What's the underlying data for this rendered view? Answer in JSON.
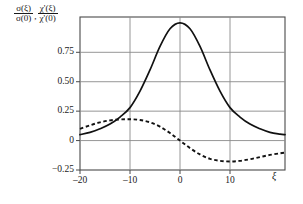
{
  "chart_data": {
    "type": "line",
    "title": "",
    "xlabel": "ξ",
    "ylabel_numerators": [
      "σ(ξ)",
      "χ'(ξ)"
    ],
    "ylabel_denominators": [
      "σ(0)",
      "χ'(0)"
    ],
    "ylabel_separator": ",",
    "xlim": [
      -20,
      21
    ],
    "ylim": [
      -0.25,
      1.05
    ],
    "grid": true,
    "legend_position": "none",
    "xticks": [
      -20,
      -10,
      0,
      10
    ],
    "xtick_labels": [
      "–20",
      "–10",
      "0",
      "10"
    ],
    "yticks": [
      -0.25,
      0,
      0.25,
      0.5,
      0.75
    ],
    "ytick_labels": [
      "−0.25",
      "0",
      "0.25",
      "0.50",
      "0.75"
    ],
    "series": [
      {
        "name": "σ(ξ)/σ(0)",
        "style": "solid",
        "color": "#111111",
        "x": [
          -20,
          -18,
          -16,
          -14,
          -12,
          -10,
          -8,
          -6,
          -4,
          -2,
          0,
          2,
          4,
          6,
          8,
          10,
          12,
          14,
          16,
          18,
          20,
          21
        ],
        "y": [
          0.05,
          0.07,
          0.1,
          0.14,
          0.2,
          0.28,
          0.42,
          0.6,
          0.8,
          0.95,
          1.0,
          0.95,
          0.8,
          0.6,
          0.42,
          0.28,
          0.2,
          0.14,
          0.1,
          0.07,
          0.055,
          0.05
        ]
      },
      {
        "name": "χ'(ξ)/χ'(0)",
        "style": "dashed",
        "color": "#111111",
        "x": [
          -20,
          -18,
          -16,
          -14,
          -12,
          -10,
          -8,
          -6,
          -4,
          -2,
          0,
          2,
          4,
          6,
          8,
          10,
          12,
          14,
          16,
          18,
          20,
          21
        ],
        "y": [
          0.1,
          0.13,
          0.155,
          0.172,
          0.18,
          0.181,
          0.175,
          0.155,
          0.118,
          0.064,
          0.0,
          -0.064,
          -0.118,
          -0.155,
          -0.172,
          -0.178,
          -0.172,
          -0.158,
          -0.14,
          -0.122,
          -0.108,
          -0.102
        ]
      }
    ],
    "annotations": []
  },
  "plot_box": {
    "left": 80,
    "top": 17,
    "right": 285,
    "bottom": 170
  }
}
